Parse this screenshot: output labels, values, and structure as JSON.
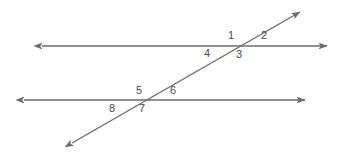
{
  "figure": {
    "background_color": "#ffffff",
    "line_color": "#6b6b6b",
    "label_color": "#4a4a4a",
    "line_width": 1.4
  },
  "lines": [
    {
      "name": "upper-parallel-line",
      "type": "double-arrow-line",
      "x1": 42,
      "y1": 46,
      "x2": 327,
      "y2": 46
    },
    {
      "name": "lower-parallel-line",
      "type": "double-arrow-line",
      "x1": 24,
      "y1": 100,
      "x2": 305,
      "y2": 100
    },
    {
      "name": "transversal-line",
      "type": "double-arrow-line",
      "x1": 72,
      "y1": 143,
      "x2": 300,
      "y2": 12
    }
  ],
  "intersections": [
    {
      "name": "upper-intersection",
      "x": 242,
      "y": 46
    },
    {
      "name": "lower-intersection",
      "x": 143,
      "y": 100
    }
  ],
  "angle_labels": [
    {
      "id": "1",
      "text": "1",
      "x": 231,
      "y": 35,
      "position": "upper-left-of-upper-intersection"
    },
    {
      "id": "2",
      "text": "2",
      "x": 264,
      "y": 35,
      "position": "upper-right-of-upper-intersection"
    },
    {
      "id": "3",
      "text": "3",
      "x": 239,
      "y": 54,
      "position": "lower-right-of-upper-intersection"
    },
    {
      "id": "4",
      "text": "4",
      "x": 207,
      "y": 53,
      "position": "lower-left-of-upper-intersection"
    },
    {
      "id": "5",
      "text": "5",
      "x": 139,
      "y": 90,
      "position": "upper-left-of-lower-intersection"
    },
    {
      "id": "6",
      "text": "6",
      "x": 173,
      "y": 90,
      "position": "upper-right-of-lower-intersection"
    },
    {
      "id": "7",
      "text": "7",
      "x": 142,
      "y": 108,
      "position": "lower-right-of-lower-intersection"
    },
    {
      "id": "8",
      "text": "8",
      "x": 112,
      "y": 108,
      "position": "lower-left-of-lower-intersection"
    }
  ]
}
